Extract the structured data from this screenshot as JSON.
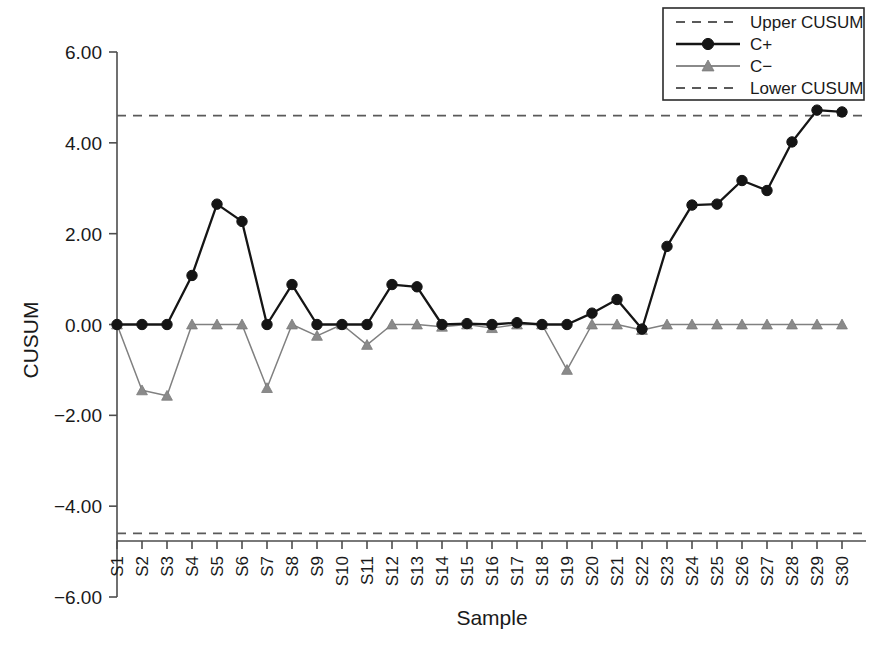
{
  "chart_data": {
    "type": "line",
    "title": "",
    "xlabel": "Sample",
    "ylabel": "CUSUM",
    "categories": [
      "S1",
      "S2",
      "S3",
      "S4",
      "S5",
      "S6",
      "S7",
      "S8",
      "S9",
      "S10",
      "S11",
      "S12",
      "S13",
      "S14",
      "S15",
      "S16",
      "S17",
      "S18",
      "S19",
      "S20",
      "S21",
      "S22",
      "S23",
      "S24",
      "S25",
      "S26",
      "S27",
      "S28",
      "S29",
      "S30"
    ],
    "series": [
      {
        "name": "C+",
        "marker": "circle",
        "color": "#151515",
        "style": "solid",
        "values": [
          0.0,
          0.0,
          0.0,
          1.08,
          2.65,
          2.27,
          0.0,
          0.88,
          0.0,
          0.0,
          0.0,
          0.88,
          0.83,
          0.0,
          0.02,
          0.0,
          0.04,
          0.0,
          0.0,
          0.25,
          0.55,
          -0.1,
          1.72,
          2.63,
          2.65,
          3.17,
          2.95,
          4.02,
          4.72,
          4.68
        ]
      },
      {
        "name": "C−",
        "marker": "triangle",
        "color": "#8a8a8a",
        "style": "solid",
        "values": [
          0.0,
          -1.45,
          -1.57,
          0.0,
          0.0,
          0.0,
          -1.4,
          0.0,
          -0.25,
          0.0,
          -0.45,
          0.0,
          0.0,
          -0.05,
          0.0,
          -0.08,
          0.0,
          0.0,
          -1.0,
          0.0,
          0.0,
          -0.12,
          0.0,
          0.0,
          0.0,
          0.0,
          0.0,
          0.0,
          0.0,
          0.0
        ]
      }
    ],
    "limits": [
      {
        "name": "Upper CUSUM",
        "value": 4.6,
        "style": "dashed",
        "color": "#5a5a5a"
      },
      {
        "name": "Lower CUSUM",
        "value": -4.6,
        "style": "dashed",
        "color": "#5a5a5a"
      }
    ],
    "yticks": [
      "6.00",
      "4.00",
      "2.00",
      "0.00",
      "-2.00",
      "-4.00",
      "-6.00"
    ],
    "ytick_values": [
      6,
      4,
      2,
      0,
      -2,
      -4,
      -6
    ],
    "ylim": [
      -6,
      6
    ],
    "grid": false,
    "legend_position": "top-right"
  },
  "legend": {
    "entries": [
      {
        "label": "Upper CUSUM",
        "kind": "dashed"
      },
      {
        "label": "C+",
        "kind": "line-circle"
      },
      {
        "label": "C−",
        "kind": "line-triangle"
      },
      {
        "label": "Lower CUSUM",
        "kind": "dashed"
      }
    ]
  },
  "axes": {
    "y_title": "CUSUM",
    "x_title": "Sample"
  },
  "footer": {
    "artifact_text": ""
  }
}
